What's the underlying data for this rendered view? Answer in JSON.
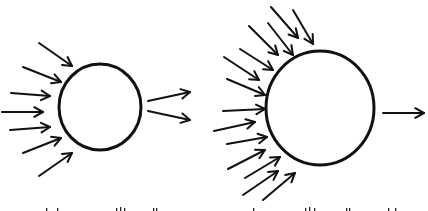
{
  "diagram": {
    "stroke_color": "#111111",
    "background": "#ffffff",
    "panels": [
      {
        "id": "left",
        "circle": {
          "cx": 100,
          "cy": 107,
          "rx": 41,
          "ry": 43
        },
        "incoming_arrows": [
          {
            "x1": 39,
            "y1": 43,
            "x2": 72,
            "y2": 66
          },
          {
            "x1": 23,
            "y1": 67,
            "x2": 61,
            "y2": 82
          },
          {
            "x1": 11,
            "y1": 93,
            "x2": 50,
            "y2": 96
          },
          {
            "x1": 2,
            "y1": 112,
            "x2": 43,
            "y2": 112
          },
          {
            "x1": 10,
            "y1": 130,
            "x2": 50,
            "y2": 127
          },
          {
            "x1": 23,
            "y1": 153,
            "x2": 61,
            "y2": 138
          },
          {
            "x1": 39,
            "y1": 176,
            "x2": 72,
            "y2": 153
          }
        ],
        "outgoing_arrows": [
          {
            "x1": 148,
            "y1": 101,
            "x2": 190,
            "y2": 92
          },
          {
            "x1": 148,
            "y1": 111,
            "x2": 190,
            "y2": 120
          }
        ],
        "caption_clipped": true
      },
      {
        "id": "right",
        "circle": {
          "cx": 320,
          "cy": 108,
          "rx": 54,
          "ry": 57
        },
        "incoming_arrows": [
          {
            "x1": 271,
            "y1": 7,
            "x2": 298,
            "y2": 38
          },
          {
            "x1": 293,
            "y1": 10,
            "x2": 313,
            "y2": 44
          },
          {
            "x1": 268,
            "y1": 23,
            "x2": 293,
            "y2": 55
          },
          {
            "x1": 249,
            "y1": 26,
            "x2": 278,
            "y2": 55
          },
          {
            "x1": 240,
            "y1": 49,
            "x2": 273,
            "y2": 70
          },
          {
            "x1": 224,
            "y1": 57,
            "x2": 259,
            "y2": 80
          },
          {
            "x1": 227,
            "y1": 79,
            "x2": 265,
            "y2": 95
          },
          {
            "x1": 223,
            "y1": 111,
            "x2": 265,
            "y2": 109
          },
          {
            "x1": 214,
            "y1": 131,
            "x2": 255,
            "y2": 122
          },
          {
            "x1": 227,
            "y1": 144,
            "x2": 267,
            "y2": 137
          },
          {
            "x1": 228,
            "y1": 169,
            "x2": 265,
            "y2": 150
          },
          {
            "x1": 245,
            "y1": 178,
            "x2": 280,
            "y2": 157
          },
          {
            "x1": 243,
            "y1": 195,
            "x2": 278,
            "y2": 171
          },
          {
            "x1": 263,
            "y1": 200,
            "x2": 295,
            "y2": 173
          }
        ],
        "outgoing_arrows": [
          {
            "x1": 383,
            "y1": 113,
            "x2": 424,
            "y2": 113
          }
        ],
        "caption_clipped": true
      }
    ]
  }
}
